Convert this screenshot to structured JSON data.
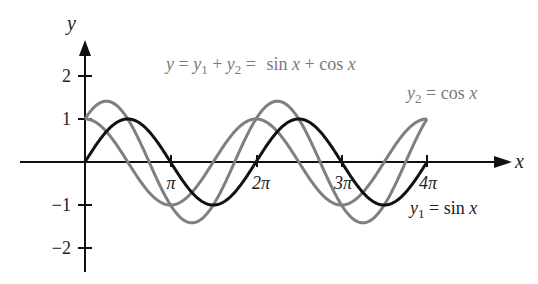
{
  "chart_data": {
    "type": "line",
    "title": "",
    "xlabel": "x",
    "ylabel": "y",
    "x_tick_labels": [
      "π",
      "2π",
      "3π",
      "4π"
    ],
    "x_tick_values": [
      3.14159,
      6.28319,
      9.42478,
      12.56637
    ],
    "y_tick_labels": [
      "2",
      "1",
      "−1",
      "−2"
    ],
    "y_tick_values": [
      2,
      1,
      -1,
      -2
    ],
    "xlim": [
      -2.9,
      14.6
    ],
    "ylim": [
      -2.5,
      3.0
    ],
    "grid": false,
    "legend": "inline annotations",
    "series": [
      {
        "name": "y1 = sin x",
        "function": "sin",
        "color": "#111111",
        "x_range": [
          0,
          12.566
        ]
      },
      {
        "name": "y2 = cos x",
        "function": "cos",
        "color": "#7f7f7f",
        "x_range": [
          0,
          12.566
        ]
      },
      {
        "name": "y = y1 + y2 = sin x + cos x",
        "function": "sin+cos",
        "color": "#7f7f7f",
        "x_range": [
          0,
          12.566
        ]
      }
    ],
    "annotations": [
      {
        "text": "y = y1 + y2 = sin x + cos x",
        "position": "top-center"
      },
      {
        "text": "y2 = cos x",
        "position": "upper-right"
      },
      {
        "text": "y1 = sin x",
        "position": "lower-right"
      }
    ]
  },
  "labels": {
    "y_axis": "y",
    "x_axis": "x",
    "ticks_x": [
      "π",
      "2π",
      "3π",
      "4π"
    ],
    "ticks_y": {
      "p2": "2",
      "p1": "1",
      "m1": "−1",
      "m2": "−2"
    },
    "sum": {
      "y": "y",
      "eq1": " = ",
      "y1": "y",
      "sub1": "1",
      "plus": " + ",
      "y2": "y",
      "sub2": "2",
      "eq2": " = ",
      "rhs": "sin ",
      "x1": "x",
      "plus2": " + cos ",
      "x2": "x"
    },
    "cos": {
      "y": "y",
      "sub": "2",
      "rhs": " = cos ",
      "x": "x"
    },
    "sin": {
      "y": "y",
      "sub": "1",
      "rhs": " = sin ",
      "x": "x"
    }
  }
}
